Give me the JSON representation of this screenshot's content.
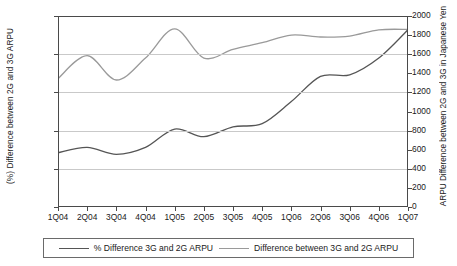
{
  "chart_data": {
    "type": "line",
    "title": "",
    "xlabel": "",
    "categories": [
      "1Q04",
      "2Q04",
      "3Q04",
      "4Q04",
      "1Q05",
      "2Q05",
      "3Q05",
      "4Q05",
      "1Q06",
      "2Q06",
      "3Q06",
      "4Q06",
      "1Q07"
    ],
    "axes": {
      "left": {
        "label": "(%) Difference between 2G and 3G ARPU",
        "ticks": [
          "0",
          "0.5",
          "1",
          "1.5",
          "2",
          "2.5"
        ],
        "tick_values": [
          0,
          0.5,
          1,
          1.5,
          2,
          2.5
        ],
        "ylim": [
          0,
          2.5
        ]
      },
      "right": {
        "label": "ARPU Difference between 2G and 3G in Japanese Yen",
        "ticks": [
          "0",
          "200",
          "400",
          "600",
          "800",
          "1000",
          "1200",
          "1400",
          "1600",
          "1800",
          "2000"
        ],
        "tick_values": [
          0,
          200,
          400,
          600,
          800,
          1000,
          1200,
          1400,
          1600,
          1800,
          2000
        ],
        "ylim": [
          0,
          2000
        ]
      }
    },
    "grid": true,
    "legend_position": "bottom",
    "series": [
      {
        "name": "% Difference 3G and 2G ARPU",
        "axis": "left",
        "color": "#555555",
        "values": [
          0.71,
          0.78,
          0.69,
          0.78,
          1.02,
          0.92,
          1.05,
          1.09,
          1.38,
          1.71,
          1.73,
          1.95,
          2.32
        ]
      },
      {
        "name": "Difference between 3G and 2G ARPU",
        "axis": "right",
        "color": "#9a9a9a",
        "values": [
          1345,
          1585,
          1330,
          1560,
          1865,
          1560,
          1650,
          1720,
          1800,
          1780,
          1790,
          1855,
          1860
        ]
      }
    ]
  },
  "legend": {
    "items": [
      {
        "label": "% Difference 3G and 2G ARPU",
        "swatch": "line-swatch-dark"
      },
      {
        "label": "Difference between 3G and 2G ARPU",
        "swatch": "line-swatch-light"
      }
    ]
  }
}
